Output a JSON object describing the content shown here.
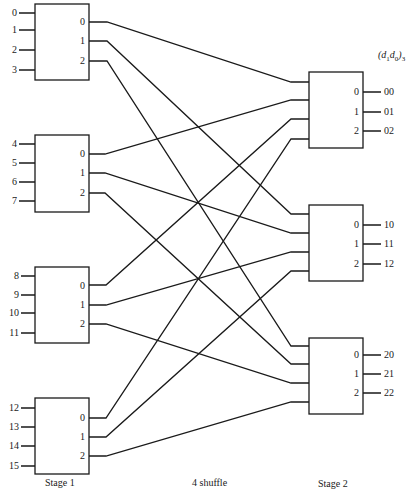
{
  "diagram": {
    "header_label": {
      "open": "(",
      "d1": "d",
      "s1": "1",
      "d0": "d",
      "s0": "0",
      "close": ")",
      "base": "3"
    },
    "stage1": {
      "label": "Stage 1",
      "boxes": [
        {
          "inputs": [
            "0",
            "1",
            "2",
            "3"
          ],
          "outputs": [
            "0",
            "1",
            "2"
          ]
        },
        {
          "inputs": [
            "4",
            "5",
            "6",
            "7"
          ],
          "outputs": [
            "0",
            "1",
            "2"
          ]
        },
        {
          "inputs": [
            "8",
            "9",
            "10",
            "11"
          ],
          "outputs": [
            "0",
            "1",
            "2"
          ]
        },
        {
          "inputs": [
            "12",
            "13",
            "14",
            "15"
          ],
          "outputs": [
            "0",
            "1",
            "2"
          ]
        }
      ]
    },
    "interconnect": {
      "label": "4 shuffle"
    },
    "stage2": {
      "label": "Stage 2",
      "boxes": [
        {
          "outputs": [
            "0",
            "1",
            "2"
          ],
          "addresses": [
            "00",
            "01",
            "02"
          ]
        },
        {
          "outputs": [
            "0",
            "1",
            "2"
          ],
          "addresses": [
            "10",
            "11",
            "12"
          ]
        },
        {
          "outputs": [
            "0",
            "1",
            "2"
          ],
          "addresses": [
            "20",
            "21",
            "22"
          ]
        }
      ]
    },
    "line_color": "#1a1a1a"
  }
}
